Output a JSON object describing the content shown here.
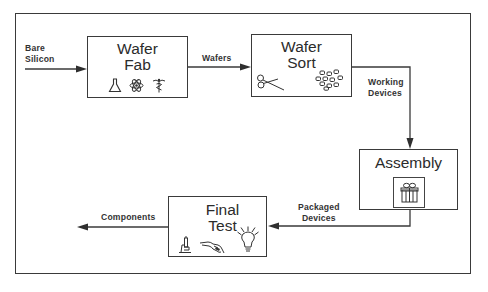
{
  "diagram": {
    "type": "process-flow",
    "stages": [
      {
        "id": "wafer-fab",
        "title_lines": [
          "Wafer",
          "Fab"
        ],
        "icons": [
          "flask-icon",
          "atom-icon",
          "caduceus-icon"
        ]
      },
      {
        "id": "wafer-sort",
        "title_lines": [
          "Wafer",
          "Sort"
        ],
        "icons": [
          "scissors-icon",
          "dice-chips-icon"
        ]
      },
      {
        "id": "assembly",
        "title_lines": [
          "Assembly"
        ],
        "icons": [
          "gift-package-icon"
        ]
      },
      {
        "id": "final-test",
        "title_lines": [
          "Final",
          "Test"
        ],
        "icons": [
          "microscope-icon",
          "probe-hand-icon",
          "light-bulb-icon"
        ]
      }
    ],
    "flows": [
      {
        "from": "input",
        "to": "wafer-fab",
        "label_lines": [
          "Bare",
          "Silicon"
        ]
      },
      {
        "from": "wafer-fab",
        "to": "wafer-sort",
        "label_lines": [
          "Wafers"
        ]
      },
      {
        "from": "wafer-sort",
        "to": "assembly",
        "label_lines": [
          "Working",
          "Devices"
        ]
      },
      {
        "from": "assembly",
        "to": "final-test",
        "label_lines": [
          "Packaged",
          "Devices"
        ]
      },
      {
        "from": "final-test",
        "to": "output",
        "label_lines": [
          "Components"
        ]
      }
    ]
  },
  "labels": {
    "bare_silicon": "Bare\nSilicon",
    "wafers": "Wafers",
    "working_devices": "Working\nDevices",
    "packaged_devices": "Packaged\nDevices",
    "components": "Components"
  },
  "boxes": {
    "wafer_fab": {
      "line1": "Wafer",
      "line2": "Fab"
    },
    "wafer_sort": {
      "line1": "Wafer",
      "line2": "Sort"
    },
    "assembly": {
      "line1": "Assembly"
    },
    "final_test": {
      "line1": "Final",
      "line2": "Test"
    }
  },
  "colors": {
    "line": "#3a3a3a",
    "text": "#2b2b2b",
    "background": "#ffffff"
  }
}
